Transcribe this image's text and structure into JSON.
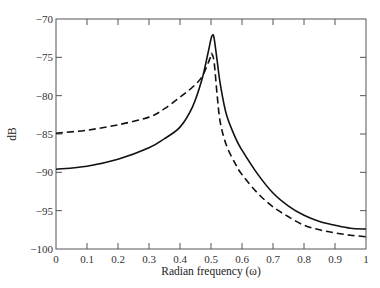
{
  "chart_data": {
    "type": "line",
    "title": "",
    "xlabel": "Radian frequency (ω)",
    "ylabel": "dB",
    "xlim": [
      0,
      1
    ],
    "ylim": [
      -100,
      -70
    ],
    "xticks": [
      0,
      0.1,
      0.2,
      0.3,
      0.4,
      0.5,
      0.6,
      0.7,
      0.8,
      0.9,
      1
    ],
    "xtick_labels": [
      "0",
      "0.1",
      "0.2",
      "0.3",
      "0.4",
      "0.5",
      "0.6",
      "0.7",
      "0.8",
      "0.9",
      "1"
    ],
    "yticks": [
      -100,
      -95,
      -90,
      -85,
      -80,
      -75,
      -70
    ],
    "ytick_labels": [
      "−100",
      "−95",
      "−90",
      "−85",
      "−80",
      "−75",
      "−70"
    ],
    "grid": false,
    "legend": null,
    "series": [
      {
        "name": "solid",
        "style": "solid",
        "color": "#111111",
        "x": [
          0,
          0.1,
          0.2,
          0.3,
          0.35,
          0.4,
          0.44,
          0.47,
          0.49,
          0.5,
          0.505,
          0.51,
          0.52,
          0.53,
          0.55,
          0.58,
          0.6,
          0.65,
          0.7,
          0.75,
          0.8,
          0.85,
          0.9,
          0.95,
          1.0
        ],
        "y": [
          -89.6,
          -89.2,
          -88.3,
          -86.8,
          -85.6,
          -84.1,
          -81.5,
          -78.0,
          -74.5,
          -72.6,
          -72.1,
          -72.5,
          -75.5,
          -78.5,
          -82.5,
          -85.6,
          -87.1,
          -90.2,
          -92.7,
          -94.4,
          -95.6,
          -96.4,
          -96.9,
          -97.3,
          -97.4
        ]
      },
      {
        "name": "dashed",
        "style": "dashed",
        "color": "#111111",
        "x": [
          0,
          0.1,
          0.2,
          0.3,
          0.35,
          0.4,
          0.44,
          0.47,
          0.49,
          0.5,
          0.502,
          0.51,
          0.52,
          0.53,
          0.55,
          0.58,
          0.6,
          0.65,
          0.7,
          0.75,
          0.8,
          0.85,
          0.9,
          0.95,
          1.0
        ],
        "y": [
          -84.9,
          -84.5,
          -83.8,
          -82.8,
          -81.7,
          -80.2,
          -78.9,
          -77.6,
          -75.8,
          -74.8,
          -74.5,
          -75.6,
          -80.0,
          -83.5,
          -86.5,
          -89.0,
          -90.3,
          -92.7,
          -94.5,
          -95.8,
          -96.9,
          -97.5,
          -97.9,
          -98.2,
          -98.4
        ]
      }
    ]
  }
}
